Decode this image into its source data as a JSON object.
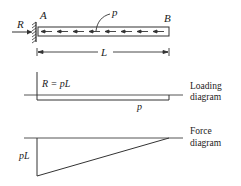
{
  "figure": {
    "beam": {
      "left_label": "A",
      "right_label": "B",
      "load_label": "p",
      "reaction_label": "R",
      "length_label": "L"
    },
    "loading_diagram": {
      "reaction_text": "R = pL",
      "load_text": "p",
      "caption_line1": "Loading",
      "caption_line2": "diagram"
    },
    "force_diagram": {
      "max_text": "pL",
      "caption_line1": "Force",
      "caption_line2": "diagram"
    },
    "colors": {
      "line": "#333333",
      "text": "#222222"
    }
  }
}
